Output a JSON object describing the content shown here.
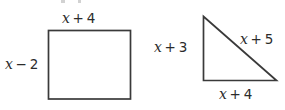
{
  "figure": {
    "type": "geometry-diagram",
    "background_color": "#ffffff",
    "stroke_color": "#3a3a3a",
    "text_color": "#2b2b2b",
    "shapes": [
      {
        "name": "rectangle",
        "labels": {
          "top": {
            "variable": "x",
            "operator": "+",
            "constant": "4"
          },
          "left": {
            "variable": "x",
            "operator": "−",
            "constant": "2"
          }
        }
      },
      {
        "name": "right-triangle",
        "labels": {
          "vertical_leg": {
            "variable": "x",
            "operator": "+",
            "constant": "3"
          },
          "hypotenuse": {
            "variable": "x",
            "operator": "+",
            "constant": "5"
          },
          "horizontal_leg": {
            "variable": "x",
            "operator": "+",
            "constant": "4"
          }
        }
      }
    ]
  }
}
